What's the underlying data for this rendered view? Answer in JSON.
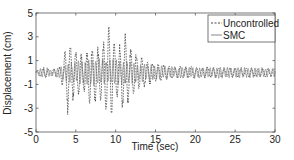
{
  "chart_data": {
    "type": "line",
    "title": "",
    "xlabel": "Time (sec)",
    "ylabel": "Displacement (cm)",
    "xlim": [
      0,
      30
    ],
    "ylim": [
      -5,
      5
    ],
    "xticks": [
      0,
      5,
      10,
      15,
      20,
      25,
      30
    ],
    "yticks": [
      -5,
      -3,
      -1,
      1,
      3,
      5
    ],
    "grid": false,
    "legend_position": "upper right",
    "series": [
      {
        "name": "Uncontrolled",
        "style": "dashed",
        "color": "#333333",
        "envelope": {
          "t": [
            0,
            1,
            2,
            3,
            3.5,
            4,
            4.5,
            5,
            6,
            7,
            8,
            8.5,
            9,
            9.5,
            10,
            10.5,
            11,
            11.5,
            12,
            13,
            14,
            15,
            17,
            20,
            25,
            30
          ],
          "upper": [
            0.2,
            0.4,
            0.3,
            0.5,
            1.5,
            3.5,
            2.5,
            2.0,
            1.5,
            2.8,
            2.0,
            3.0,
            4.1,
            3.8,
            2.2,
            2.5,
            3.6,
            3.0,
            2.0,
            1.5,
            1.2,
            0.8,
            0.6,
            0.5,
            0.4,
            0.4
          ],
          "lower": [
            -0.2,
            -0.5,
            -0.3,
            -0.6,
            -1.5,
            -3.8,
            -2.6,
            -2.2,
            -1.8,
            -3.0,
            -2.5,
            -3.2,
            -4.2,
            -3.8,
            -2.4,
            -2.6,
            -3.8,
            -3.2,
            -2.0,
            -1.6,
            -1.2,
            -0.8,
            -0.6,
            -0.5,
            -0.4,
            -0.4
          ]
        }
      },
      {
        "name": "SMC",
        "style": "solid",
        "color": "#777777",
        "envelope": {
          "t": [
            0,
            1,
            2,
            3,
            4,
            6,
            8,
            10,
            12,
            14,
            15,
            20,
            25,
            30
          ],
          "upper": [
            0.2,
            0.5,
            0.3,
            0.5,
            0.9,
            1.1,
            1.3,
            1.2,
            1.0,
            0.8,
            0.6,
            0.5,
            0.5,
            0.4
          ],
          "lower": [
            -0.2,
            -0.6,
            -0.3,
            -0.5,
            -0.9,
            -1.1,
            -1.3,
            -1.2,
            -1.0,
            -0.8,
            -0.6,
            -0.5,
            -0.5,
            -0.4
          ]
        }
      }
    ]
  },
  "legend": {
    "items": [
      {
        "label": "Uncontrolled"
      },
      {
        "label": "SMC"
      }
    ]
  },
  "axes": {
    "xlabel": "Time (sec)",
    "ylabel": "Displacement (cm)",
    "xtick_labels": [
      "0",
      "5",
      "10",
      "15",
      "20",
      "25",
      "30"
    ],
    "ytick_labels": [
      "5",
      "3",
      "1",
      "-1",
      "-3",
      "-5"
    ]
  },
  "colors": {
    "axis": "#555555",
    "uncontrolled": "#333333",
    "smc": "#7a7a7a"
  }
}
